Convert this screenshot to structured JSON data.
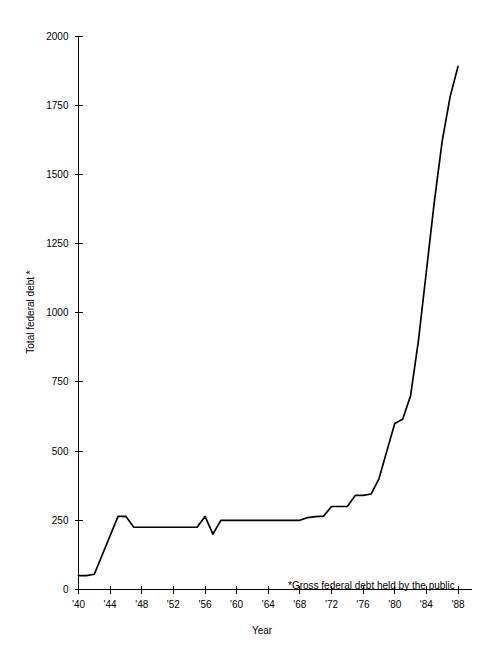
{
  "chart_data": {
    "type": "line",
    "title": "",
    "subtitle": "",
    "xlabel": "Year",
    "ylabel": "Total federal debt *",
    "footnote": "*Gross federal debt held by the public",
    "xlim": [
      1940,
      1989
    ],
    "ylim": [
      0,
      2000
    ],
    "grid": false,
    "legend": false,
    "legend_position": "none",
    "units": "billions of dollars",
    "x_tick_labels": [
      "'40",
      "'44",
      "'48",
      "'52",
      "'56",
      "'60",
      "'64",
      "'68",
      "'72",
      "'76",
      "'80",
      "'84",
      "'88"
    ],
    "x_tick_values": [
      1940,
      1944,
      1948,
      1952,
      1956,
      1960,
      1964,
      1968,
      1972,
      1976,
      1980,
      1984,
      1988
    ],
    "y_tick_labels": [
      "0",
      "250",
      "500",
      "750",
      "1000",
      "1250",
      "1500",
      "1750",
      "2000"
    ],
    "y_tick_values": [
      0,
      250,
      500,
      750,
      1000,
      1250,
      1500,
      1750,
      2000
    ],
    "series": [
      {
        "name": "Total federal debt",
        "color": "#000000",
        "x": [
          1940,
          1941,
          1942,
          1945,
          1946,
          1947,
          1955,
          1956,
          1957,
          1958,
          1959,
          1967,
          1968,
          1969,
          1970,
          1971,
          1972,
          1973,
          1974,
          1975,
          1976,
          1977,
          1978,
          1979,
          1980,
          1981,
          1982,
          1983,
          1984,
          1985,
          1986,
          1987,
          1988
        ],
        "y": [
          50,
          50,
          55,
          264,
          264,
          225,
          225,
          264,
          200,
          250,
          250,
          250,
          250,
          260,
          263,
          265,
          300,
          300,
          300,
          340,
          340,
          345,
          400,
          500,
          600,
          615,
          700,
          900,
          1150,
          1400,
          1620,
          1780,
          1890
        ]
      }
    ]
  }
}
